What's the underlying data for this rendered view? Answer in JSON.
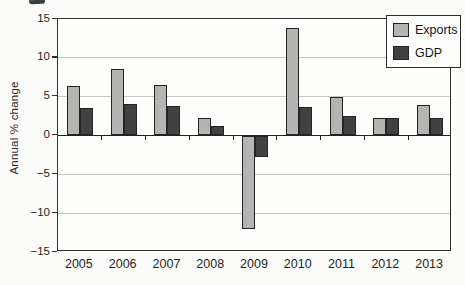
{
  "chart_data": {
    "type": "bar",
    "ylabel": "Annual % change",
    "categories": [
      "2005",
      "2006",
      "2007",
      "2008",
      "2009",
      "2010",
      "2011",
      "2012",
      "2013"
    ],
    "series": [
      {
        "name": "Exports",
        "color": "#b4b4b2",
        "values": [
          6.4,
          8.5,
          6.5,
          2.2,
          -12.0,
          13.8,
          5.0,
          2.3,
          3.9
        ]
      },
      {
        "name": "GDP",
        "color": "#414141",
        "values": [
          3.5,
          4.0,
          3.8,
          1.2,
          -2.8,
          3.7,
          2.5,
          2.2,
          2.2
        ]
      }
    ],
    "ylim": [
      -15,
      15
    ],
    "yticks": [
      15,
      10,
      5,
      0,
      -5,
      -10,
      -15
    ],
    "grid": true,
    "legend_position": "top-right",
    "minus_sign": "−"
  }
}
